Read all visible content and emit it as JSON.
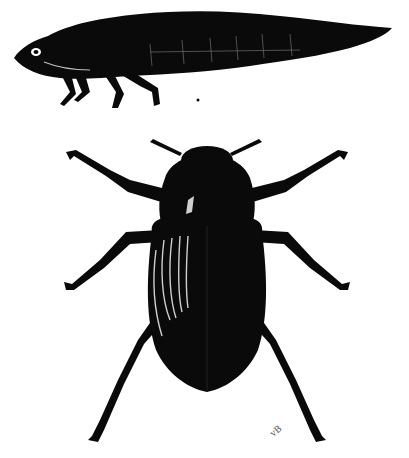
{
  "plate": {
    "background": "#ffffff",
    "ink": "#0a0a0a",
    "figures": [
      {
        "id": "larva",
        "description": "aquatic beetle larva, lateral view"
      },
      {
        "id": "adult",
        "description": "adult water beetle, dorsal view"
      }
    ],
    "marks": {
      "larva_mark": "•",
      "signature": "vB"
    }
  }
}
